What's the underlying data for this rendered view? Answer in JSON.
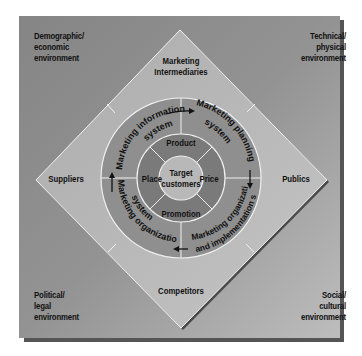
{
  "diagram": {
    "corners": {
      "top_left": [
        "Demographic/",
        "economic",
        "environment"
      ],
      "top_right": [
        "Technical/",
        "physical",
        "environment"
      ],
      "bottom_left": [
        "Political/",
        "legal",
        "environment"
      ],
      "bottom_right": [
        "Social/",
        "cultural",
        "environment"
      ]
    },
    "diamond": {
      "top": [
        "Marketing",
        "Intermediaries"
      ],
      "left": "Suppliers",
      "right": "Publics",
      "bottom": "Competitors"
    },
    "outer_ring": {
      "top_left": [
        "Marketing information",
        "system"
      ],
      "top_right": [
        "Marketing planning",
        "system"
      ],
      "bottom_right": [
        "Marketing organization",
        "and implementation system"
      ],
      "bottom_left": [
        "Marketing organization",
        "system"
      ]
    },
    "inner_ring": {
      "top": "Product",
      "right": "Price",
      "bottom": "Promotion",
      "left": "Place"
    },
    "center": [
      "Target",
      "customers"
    ],
    "colors": {
      "background_square": "#8a8a8a",
      "diamond": "#b3b3b3",
      "outer_ring": "#8f8f8f",
      "inner_ring": "#7a7a7a",
      "center": "#b8b8b8",
      "lines": "#f0f0f0",
      "shadow": "#555555"
    }
  }
}
